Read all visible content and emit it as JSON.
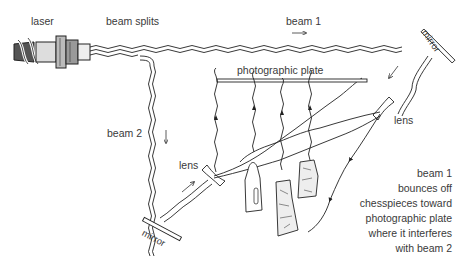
{
  "diagram": {
    "type": "holography-setup",
    "labels": {
      "laser": "laser",
      "beam_splits": "beam splits",
      "beam1": "beam 1",
      "beam2": "beam 2",
      "mirror_top": "mirror",
      "mirror_bottom": "mirror",
      "plate": "photographic plate",
      "lens_left": "lens",
      "lens_right": "lens"
    },
    "caption": [
      "beam 1",
      "bounces off",
      "chesspieces toward",
      "photographic plate",
      "where it interferes",
      "with beam 2"
    ],
    "components": [
      {
        "name": "laser",
        "icon": "laser-device-icon"
      },
      {
        "name": "mirror-top-right",
        "icon": "mirror-icon"
      },
      {
        "name": "mirror-bottom-left",
        "icon": "mirror-icon"
      },
      {
        "name": "lens-left",
        "icon": "concave-lens-icon"
      },
      {
        "name": "lens-right",
        "icon": "concave-lens-icon"
      },
      {
        "name": "photographic-plate",
        "icon": "plate-icon"
      },
      {
        "name": "chess-pieces",
        "icon": "chess-piece-icon",
        "count": 3
      }
    ],
    "colors": {
      "ink": "#222222",
      "text": "#3a3a3a",
      "background": "#ffffff"
    }
  }
}
